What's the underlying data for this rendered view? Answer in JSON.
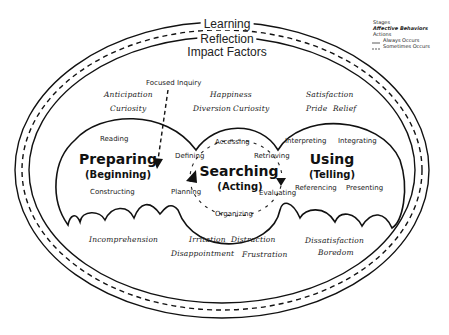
{
  "rings": {
    "outer": "Learning",
    "middle": "Reflection",
    "inner": "Impact Factors"
  },
  "legend": {
    "stages": "Stages",
    "affective": "Affective Behaviors",
    "actions": "Actions",
    "always": "Always Occurs",
    "sometimes": "Sometimes Occurs"
  },
  "focused_inquiry": "Focused Inquiry",
  "stages": {
    "preparing": {
      "title": "Preparing",
      "subtitle": "(Beginning)"
    },
    "searching": {
      "title": "Searching",
      "subtitle": "(Acting)"
    },
    "using": {
      "title": "Using",
      "subtitle": "(Telling)"
    }
  },
  "actions": {
    "reading": "Reading",
    "constructing": "Constructing",
    "defining": "Defining",
    "accessing": "Accessing",
    "retrieving": "Retrieving",
    "planning": "Planning",
    "evaluating": "Evaluating",
    "organizing": "Organizing",
    "interpreting": "Interpreting",
    "integrating": "Integrating",
    "referencing": "Referencing",
    "presenting": "Presenting"
  },
  "affective_top": {
    "anticipation": "Anticipation",
    "curiosity_left": "Curiosity",
    "happiness": "Happiness",
    "diversion": "Diversion",
    "curiosity_mid": "Curiosity",
    "satisfaction": "Satisfaction",
    "pride": "Pride",
    "relief": "Relief"
  },
  "affective_bottom": {
    "incomprehension": "Incomprehension",
    "irritation": "Irritation",
    "distraction": "Distraction",
    "disappointment": "Disappointment",
    "frustration": "Frustration",
    "dissatisfaction": "Dissatisfaction",
    "boredom": "Boredom"
  }
}
